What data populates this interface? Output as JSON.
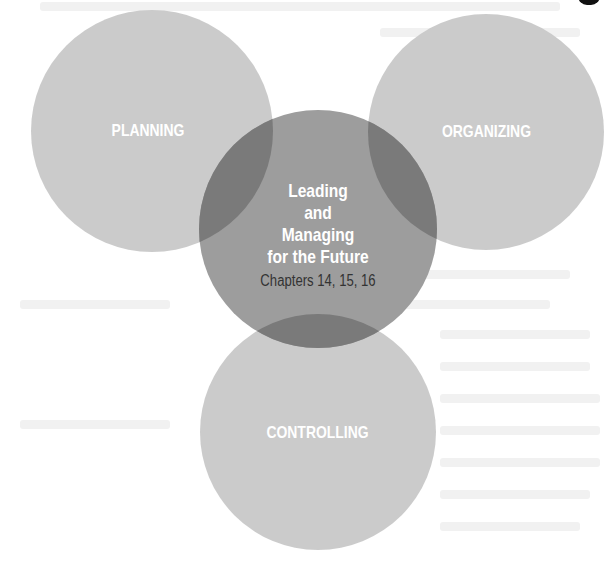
{
  "diagram": {
    "type": "venn-style overlapping circles",
    "colors": {
      "background": "#ffffff",
      "outer_circle_fill": "#c9c9c9",
      "center_circle_fill": "#9d9d9d",
      "overlap_fill": "#7a7a7a",
      "label_text": "#ffffff",
      "subtitle_text": "#333333"
    },
    "circles": [
      {
        "id": "planning",
        "label": "PLANNING",
        "cx": 152,
        "cy": 131,
        "r": 121
      },
      {
        "id": "organizing",
        "label": "ORGANIZING",
        "cx": 486,
        "cy": 132,
        "r": 118
      },
      {
        "id": "controlling",
        "label": "CONTROLLING",
        "cx": 318,
        "cy": 432,
        "r": 118
      }
    ],
    "center": {
      "cx": 318,
      "cy": 229,
      "r": 119,
      "title_lines": [
        "Leading",
        "and",
        "Managing",
        "for the Future"
      ],
      "subtitle": "Chapters 14, 15, 16"
    }
  }
}
